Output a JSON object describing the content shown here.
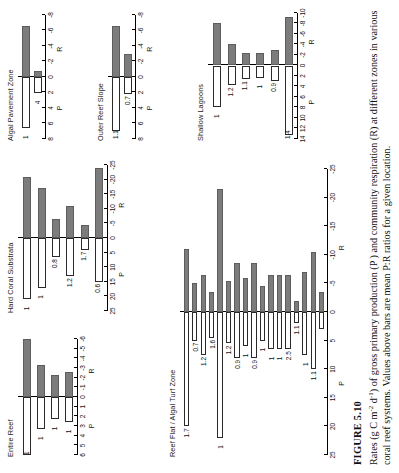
{
  "figure": {
    "number": "FIGURE 5.10",
    "caption_part1": "Rates (g C m",
    "caption_sup1": "-2",
    "caption_part2": " d",
    "caption_sup2": "-1",
    "caption_part3": ") of gross primary production (P ) and community respiration (R) at different zones in various coral reef systems. Values above bars are mean P:R ratios for a given location.",
    "p_label": "P",
    "r_label": "R",
    "colors": {
      "production_bar": "#ffffff",
      "respiration_bar": "#7c7c7c",
      "axis": "#000000",
      "text": "#111111"
    }
  },
  "chart_data": [
    {
      "type": "bar",
      "title": "Entire Reef",
      "panel_id": "entire-reef",
      "xlabel": "",
      "ylabel": "",
      "xlim": [
        6,
        -6
      ],
      "ticks": [
        "6",
        "5",
        "4",
        "3",
        "2",
        "1",
        "0",
        "-1",
        "-2",
        "-3",
        "-4",
        "-5",
        "-6"
      ],
      "tick_values": [
        6,
        5,
        4,
        3,
        2,
        1,
        0,
        -1,
        -2,
        -3,
        -4,
        -5,
        -6
      ],
      "grid": false,
      "series": [
        {
          "name": "P",
          "values": [
            6.0,
            3.3,
            2.3,
            2.6
          ]
        },
        {
          "name": "R",
          "values": [
            -6.0,
            -3.3,
            -2.3,
            -2.6
          ]
        }
      ],
      "ratio_labels": [
        "1",
        "1",
        "1",
        "1"
      ],
      "legend": [
        "P",
        "R"
      ]
    },
    {
      "type": "bar",
      "title": "Hard Coral Substrata",
      "panel_id": "hard-coral-substrata",
      "xlabel": "",
      "ylabel": "",
      "xlim": [
        25,
        -25
      ],
      "ticks": [
        "25",
        "20",
        "15",
        "10",
        "5",
        "0",
        "-5",
        "-10",
        "-15",
        "-20",
        "-25"
      ],
      "tick_values": [
        25,
        20,
        15,
        10,
        5,
        0,
        -5,
        -10,
        -15,
        -20,
        -25
      ],
      "grid": false,
      "series": [
        {
          "name": "P",
          "values": [
            21.0,
            17.0,
            6.5,
            13.0,
            4.0,
            15.0
          ]
        },
        {
          "name": "R",
          "values": [
            -21.0,
            -17.0,
            -6.5,
            -11.0,
            -4.5,
            -24.0
          ]
        }
      ],
      "ratio_labels": [
        "1",
        "1",
        "0.8",
        "1.2",
        "1.7",
        "0.6"
      ],
      "legend": [
        "P",
        "R"
      ]
    },
    {
      "type": "bar",
      "title": "Algal Pavement Zone",
      "panel_id": "algal-pavement-zone",
      "xlabel": "",
      "ylabel": "",
      "xlim": [
        8,
        -8
      ],
      "ticks": [
        "8",
        "6",
        "4",
        "2",
        "0",
        "-2",
        "-4",
        "-6",
        "-8"
      ],
      "tick_values": [
        8,
        6,
        4,
        2,
        0,
        -2,
        -4,
        -6,
        -8
      ],
      "grid": false,
      "series": [
        {
          "name": "P",
          "values": [
            6.6,
            2.1
          ]
        },
        {
          "name": "R",
          "values": [
            -6.6,
            -0.8
          ]
        }
      ],
      "ratio_labels": [
        "1",
        "4"
      ],
      "legend": [
        "P",
        "R"
      ]
    },
    {
      "type": "bar",
      "title": "Outer Reef Slope",
      "panel_id": "outer-reef-slope",
      "xlabel": "",
      "ylabel": "",
      "xlim": [
        8,
        -8
      ],
      "ticks": [
        "8",
        "6",
        "4",
        "2",
        "0",
        "-2",
        "-4",
        "-6",
        "-8"
      ],
      "tick_values": [
        8,
        6,
        4,
        2,
        0,
        -2,
        -4,
        -6,
        -8
      ],
      "grid": false,
      "series": [
        {
          "name": "P",
          "values": [
            7.0,
            2.2
          ]
        },
        {
          "name": "R",
          "values": [
            -6.6,
            -3.0
          ]
        }
      ],
      "ratio_labels": [
        "1.1",
        "0.7"
      ],
      "legend": [
        "P",
        "R"
      ]
    },
    {
      "type": "bar",
      "title": "Shallow Lagoons",
      "panel_id": "shallow-lagoons",
      "xlabel": "",
      "ylabel": "",
      "xlim": [
        14,
        -10
      ],
      "ticks": [
        "14",
        "12",
        "10",
        "8",
        "6",
        "4",
        "2",
        "0",
        "-2",
        "-4",
        "-6",
        "-8",
        "-10"
      ],
      "tick_values": [
        14,
        12,
        10,
        8,
        6,
        4,
        2,
        0,
        -2,
        -4,
        -6,
        -8,
        -10
      ],
      "grid": false,
      "series": [
        {
          "name": "P",
          "values": [
            7.9,
            3.8,
            2.6,
            2.3,
            2.9,
            13.2
          ]
        },
        {
          "name": "R",
          "values": [
            -8.0,
            -4.0,
            -2.3,
            -2.4,
            -3.0,
            -9.2
          ]
        }
      ],
      "ratio_labels": [
        "1",
        "1.2",
        "1.1",
        "1",
        "0.9",
        "1.4"
      ],
      "legend": [
        "P",
        "R"
      ]
    },
    {
      "type": "bar",
      "title": "Reef Flat / Algal Turf Zone",
      "panel_id": "reef-flat-algal-turf-zone",
      "xlabel": "",
      "ylabel": "",
      "xlim": [
        25,
        -25
      ],
      "ticks": [
        "25",
        "20",
        "15",
        "10",
        "5",
        "0",
        "-5",
        "-10",
        "-15",
        "-20",
        "-25"
      ],
      "tick_values": [
        25,
        20,
        15,
        10,
        5,
        0,
        -5,
        -10,
        -15,
        -20,
        -25
      ],
      "grid": false,
      "series": [
        {
          "name": "P",
          "values": [
            20.0,
            5.0,
            7.5,
            4.5,
            22.0,
            5.5,
            8.0,
            6.0,
            8.0,
            5.0,
            6.5,
            6.5,
            6.5,
            2.0,
            7.5,
            10.0,
            3.0
          ]
        },
        {
          "name": "R",
          "values": [
            -11.0,
            -5.0,
            -6.5,
            -3.5,
            -21.5,
            -5.5,
            -8.5,
            -6.0,
            -8.5,
            -4.5,
            -6.5,
            -6.5,
            -6.5,
            -2.0,
            -7.0,
            -10.5,
            -3.5
          ]
        }
      ],
      "ratio_labels": [
        "1.7",
        "0.7",
        "1.2",
        "1.6",
        "1",
        "1.2",
        "0.9",
        "1",
        "0.9",
        "1",
        "1",
        "1",
        "2.5",
        "1.1",
        "1",
        "1.1"
      ],
      "legend": [
        "P",
        "R"
      ]
    }
  ]
}
